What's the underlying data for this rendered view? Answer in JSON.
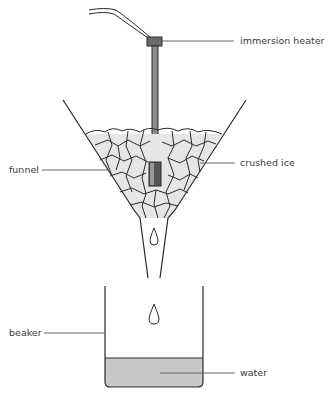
{
  "diagram": {
    "type": "apparatus",
    "labels": {
      "immersion_heater": "immersion heater",
      "crushed_ice": "crushed ice",
      "funnel": "funnel",
      "beaker": "beaker",
      "water": "water"
    },
    "colors": {
      "line": "#2a2a2a",
      "leader": "#666666",
      "ice_fill": "#e6e6e6",
      "water_fill": "#c8c8c8",
      "heater_dark": "#555555"
    }
  }
}
